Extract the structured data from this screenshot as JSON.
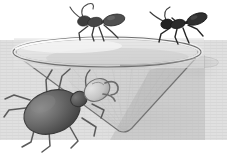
{
  "illustration": {
    "title": "Ants on the rim of a conical mesh funnel trap with a beetle inside",
    "style": "grayscale line art",
    "background_color": "#ffffff",
    "canvas": {
      "width": 227,
      "height": 162
    }
  },
  "palette": {
    "background": "#ffffff",
    "outline": "#5d5d5d",
    "rim_light": "#f2f2f2",
    "rim_shade": "#d9d9d9",
    "bowl_interior_light": "#e9e9e9",
    "bowl_interior_mid": "#d2d2d2",
    "bowl_body_light": "#dcdcdc",
    "bowl_body_mid": "#c6c6c6",
    "bowl_body_dark": "#a8a8a8",
    "mesh_line": "#bdbdbd",
    "ant_dark": "#2b2b2b",
    "ant_mid": "#4a4a4a",
    "ant_light": "#6e6e6e",
    "beetle_dark": "#3a3a3a",
    "beetle_mid": "#6a6a6a",
    "beetle_light": "#9a9a9a",
    "beetle_head_light": "#cfcfcf",
    "leg_stroke": "#4f4f4f",
    "shadow": "#b5b5b5"
  },
  "objects": {
    "funnel": {
      "name": "Conical mesh funnel trap",
      "rim": {
        "center_x": 107,
        "center_y": 52,
        "radius_x": 94,
        "radius_y": 15,
        "thickness": 4
      },
      "apex": {
        "x": 126,
        "y": 132
      },
      "spout": {
        "label": "side spout",
        "x": 198,
        "y": 60,
        "width": 30,
        "height": 9
      },
      "mesh": {
        "visible": true,
        "line_spacing_px": 3,
        "orientation": "horizontal"
      }
    },
    "ants": [
      {
        "id": "ant-left",
        "label": "Ant walking left on rim",
        "position": {
          "x": 95,
          "y": 26
        },
        "scale": 1.0,
        "facing": "left",
        "body_color": "#3a3a3a",
        "leg_count": 6,
        "antennae": 2
      },
      {
        "id": "ant-right",
        "label": "Ant walking right on rim",
        "position": {
          "x": 180,
          "y": 24
        },
        "scale": 1.0,
        "facing": "left",
        "body_color": "#1f1f1f",
        "leg_count": 6,
        "antennae": 2
      }
    ],
    "beetle": {
      "id": "beetle-in-funnel",
      "label": "Large beetle trapped inside funnel",
      "position": {
        "x": 62,
        "y": 105
      },
      "abdomen": {
        "center_x": 52,
        "center_y": 112,
        "radius_x": 29,
        "radius_y": 21,
        "rotation_deg": -22
      },
      "thorax": {
        "center_x": 79,
        "center_y": 99,
        "radius": 7
      },
      "head": {
        "center_x": 97,
        "center_y": 90,
        "radius_x": 13,
        "radius_y": 10,
        "rotation_deg": -30
      },
      "mandibles": 2,
      "leg_count": 8,
      "body_color": "#565656"
    },
    "shadow": {
      "label": "Soft drop shadow under funnel",
      "opacity": 0.35
    }
  },
  "labels": {
    "alt_text": "Black and white illustration showing two ants standing on the rim of a cone-shaped mesh insect trap while a large beetle lies inside the cone."
  }
}
